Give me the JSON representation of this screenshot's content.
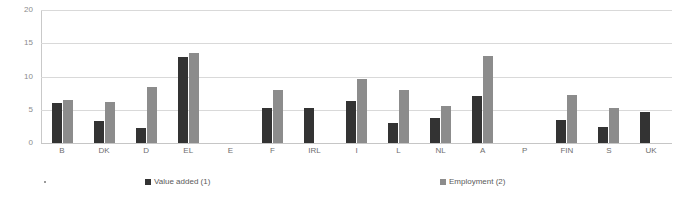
{
  "chart_data": {
    "type": "bar",
    "title": "",
    "xlabel": "",
    "ylabel": "",
    "ylim": [
      0,
      20
    ],
    "yticks": [
      "0",
      "5",
      "10",
      "15",
      "20"
    ],
    "grid": true,
    "legend_position": "bottom",
    "categories": [
      "B",
      "DK",
      "D",
      "EL",
      "E",
      "F",
      "IRL",
      "I",
      "L",
      "NL",
      "A",
      "P",
      "FIN",
      "S",
      "UK"
    ],
    "series": [
      {
        "name": "Value added (1)",
        "color": "#333333",
        "values": [
          6.0,
          3.3,
          2.3,
          13.0,
          null,
          5.3,
          5.3,
          6.3,
          3.0,
          3.7,
          7.1,
          null,
          3.5,
          2.4,
          4.6
        ]
      },
      {
        "name": "Employment (2)",
        "color": "#8c8c8c",
        "values": [
          6.4,
          6.1,
          8.4,
          13.5,
          null,
          8.0,
          null,
          9.6,
          8.0,
          5.5,
          13.1,
          null,
          7.2,
          5.3,
          null
        ]
      }
    ]
  },
  "legend": {
    "entries": [
      {
        "label": "Value added (1)",
        "color": "#333333"
      },
      {
        "label": "Employment (2)",
        "color": "#8c8c8c"
      }
    ]
  },
  "axis": {
    "y_ticks": [
      "20",
      "15",
      "10",
      "5",
      "0"
    ]
  }
}
